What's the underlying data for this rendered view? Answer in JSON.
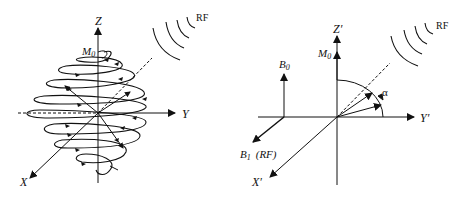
{
  "left_panel": {
    "axes": {
      "z": "Z",
      "y": "Y",
      "x": "X"
    },
    "magnetization": {
      "label": "M",
      "sub": "0"
    },
    "rf": "RF"
  },
  "right_panel": {
    "axes": {
      "z": "Z′",
      "y": "Y′",
      "x": "X′"
    },
    "magnetization": {
      "label": "M",
      "sub": "0"
    },
    "b0": {
      "label": "B",
      "sub": "0"
    },
    "b1": {
      "label": "B",
      "sub": "1",
      "suffix": "(RF)"
    },
    "angle": "α",
    "rf": "RF"
  },
  "colors": {
    "ink": "#111111",
    "background": "#ffffff"
  }
}
